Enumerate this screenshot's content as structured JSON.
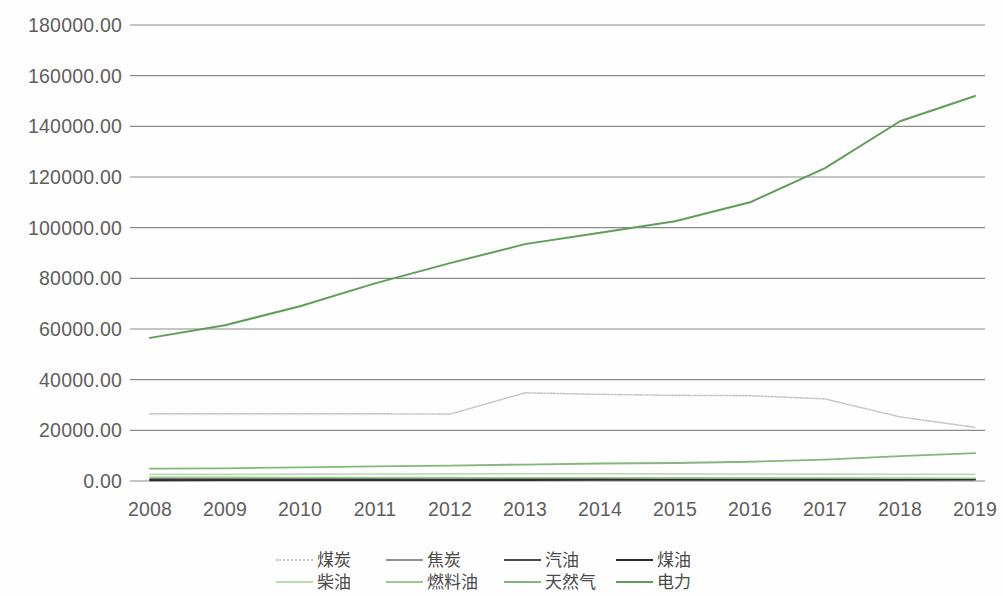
{
  "chart_data": {
    "type": "line",
    "title": "",
    "subtitle": "",
    "xlabel": "",
    "ylabel": "",
    "categories": [
      "2008",
      "2009",
      "2010",
      "2011",
      "2012",
      "2013",
      "2014",
      "2015",
      "2016",
      "2017",
      "2018",
      "2019"
    ],
    "x": [
      2008,
      2009,
      2010,
      2011,
      2012,
      2013,
      2014,
      2015,
      2016,
      2017,
      2018,
      2019
    ],
    "ylim": [
      0,
      180000
    ],
    "y_ticks": [
      0,
      20000,
      40000,
      60000,
      80000,
      100000,
      120000,
      140000,
      160000,
      180000
    ],
    "y_tick_labels": [
      "0.00",
      "20000.00",
      "40000.00",
      "60000.00",
      "80000.00",
      "100000.00",
      "120000.00",
      "140000.00",
      "160000.00",
      "180000.00"
    ],
    "grid": true,
    "grid_axis": "y",
    "legend_position": "bottom",
    "series": [
      {
        "name": "煤炭",
        "color": "#c9c6c1",
        "style": "dotted",
        "width": 1.6,
        "values": [
          26500,
          26500,
          26500,
          26500,
          26400,
          34800,
          34200,
          33800,
          33700,
          32400,
          25300,
          21200
        ]
      },
      {
        "name": "焦炭",
        "color": "#8f8f8f",
        "style": "solid",
        "width": 1.5,
        "values": [
          900,
          900,
          950,
          1000,
          1000,
          1050,
          1000,
          950,
          950,
          950,
          900,
          900
        ]
      },
      {
        "name": "汽油",
        "color": "#4a4a4a",
        "style": "solid",
        "width": 1.7,
        "values": [
          600,
          620,
          650,
          680,
          700,
          720,
          740,
          760,
          780,
          800,
          820,
          840
        ]
      },
      {
        "name": "煤油",
        "color": "#2e2e2e",
        "style": "solid",
        "width": 1.8,
        "values": [
          300,
          310,
          330,
          350,
          370,
          390,
          410,
          430,
          450,
          470,
          490,
          510
        ]
      },
      {
        "name": "柴油",
        "color": "#b9dcb3",
        "style": "solid",
        "width": 1.6,
        "values": [
          2600,
          2600,
          2700,
          2750,
          2800,
          2850,
          2850,
          2800,
          2750,
          2700,
          2650,
          2600
        ]
      },
      {
        "name": "燃料油",
        "color": "#9ccb8f",
        "style": "solid",
        "width": 1.6,
        "values": [
          1500,
          1450,
          1400,
          1400,
          1350,
          1300,
          1300,
          1250,
          1200,
          1200,
          1150,
          1100
        ]
      },
      {
        "name": "天然气",
        "color": "#84b77a",
        "style": "solid",
        "width": 1.8,
        "values": [
          4900,
          5000,
          5400,
          5800,
          6100,
          6500,
          6900,
          7100,
          7600,
          8400,
          9800,
          11000
        ]
      },
      {
        "name": "电力",
        "color": "#5f9e58",
        "style": "solid",
        "width": 2.0,
        "values": [
          56500,
          61500,
          69000,
          78000,
          86000,
          93500,
          98000,
          102500,
          110000,
          123500,
          142000,
          152000
        ]
      }
    ]
  },
  "legend": {
    "items": [
      {
        "label": "煤炭",
        "color": "#c9c6c1",
        "style": "dotted"
      },
      {
        "label": "焦炭",
        "color": "#8f8f8f",
        "style": "solid"
      },
      {
        "label": "汽油",
        "color": "#4a4a4a",
        "style": "solid"
      },
      {
        "label": "煤油",
        "color": "#2e2e2e",
        "style": "solid"
      },
      {
        "label": "柴油",
        "color": "#b9dcb3",
        "style": "solid"
      },
      {
        "label": "燃料油",
        "color": "#9ccb8f",
        "style": "solid"
      },
      {
        "label": "天然气",
        "color": "#84b77a",
        "style": "solid"
      },
      {
        "label": "电力",
        "color": "#5f9e58",
        "style": "solid"
      }
    ]
  },
  "axes": {
    "gridline_color": "#8a8a8a",
    "tick_label_color": "#5e5e5e"
  }
}
